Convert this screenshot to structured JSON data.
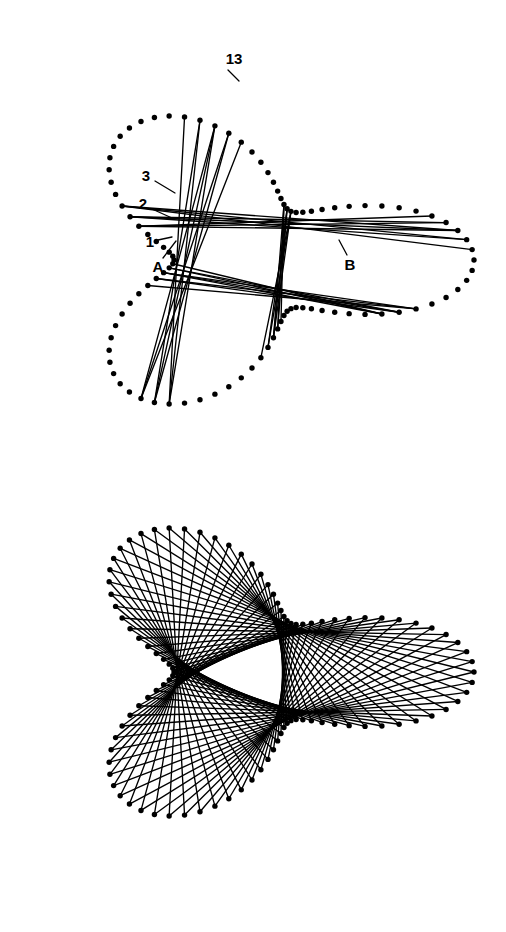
{
  "figure": {
    "background_color": "#ffffff",
    "ink_color": "#000000",
    "width": 506,
    "height": 932,
    "dot_radius": 2.7,
    "chord_stroke_width": 1.35
  },
  "labels": [
    {
      "id": "label-13",
      "text": "13",
      "x": 234,
      "y": 60,
      "leader": {
        "x1": 228,
        "y1": 70,
        "x2": 239,
        "y2": 81
      }
    },
    {
      "id": "label-3",
      "text": "3",
      "x": 146,
      "y": 177,
      "leader": {
        "x1": 155,
        "y1": 181,
        "x2": 175,
        "y2": 193
      }
    },
    {
      "id": "label-2",
      "text": "2",
      "x": 143,
      "y": 205,
      "leader": {
        "x1": 152,
        "y1": 209,
        "x2": 172,
        "y2": 218
      }
    },
    {
      "id": "label-1",
      "text": "1",
      "x": 150,
      "y": 243,
      "leader": {
        "x1": 158,
        "y1": 240,
        "x2": 172,
        "y2": 237
      }
    },
    {
      "id": "label-A",
      "text": "A",
      "x": 158,
      "y": 268,
      "leader": {
        "x1": 163,
        "y1": 258,
        "x2": 176,
        "y2": 241
      }
    },
    {
      "id": "label-B",
      "text": "B",
      "x": 350,
      "y": 266,
      "leader": {
        "x1": 347,
        "y1": 255,
        "x2": 339,
        "y2": 240
      }
    }
  ],
  "chart_data": {
    "type": "scatter",
    "xlabel": "",
    "ylabel": "",
    "grid": false,
    "legend": null,
    "xlim": [
      0,
      506
    ],
    "ylim": [
      0,
      932
    ],
    "annotations": [
      "13",
      "3",
      "2",
      "1",
      "A",
      "B"
    ],
    "curves": [
      {
        "name": "upper-trefoil",
        "kind": "epitrochoid",
        "n_points": 96,
        "center": [
          252,
          260
        ],
        "R": 150,
        "r": 52,
        "d": 72,
        "lobes": 3,
        "phase_deg": -90,
        "y_scale": 0.72,
        "dots": true,
        "chord_steps": [
          37,
          38,
          39
        ],
        "chord_count": 12,
        "chord_start_indices": [
          6,
          7,
          8,
          30,
          31,
          32,
          54,
          55,
          56,
          78,
          79,
          80
        ]
      },
      {
        "name": "lower-trefoil",
        "kind": "epitrochoid",
        "n_points": 96,
        "center": [
          252,
          672
        ],
        "R": 150,
        "r": 52,
        "d": 72,
        "lobes": 3,
        "phase_deg": 90,
        "y_scale": 0.72,
        "dots": true,
        "chord_steps": [
          37
        ],
        "chord_count": 96,
        "chord_start_indices": "all"
      }
    ]
  }
}
